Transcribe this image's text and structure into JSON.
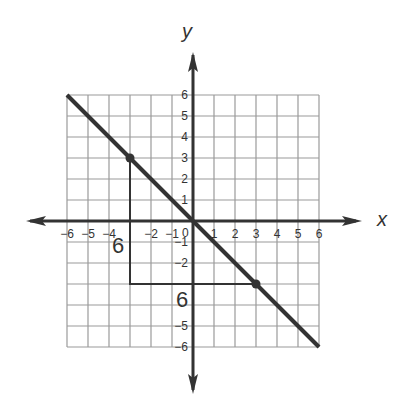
{
  "axes": {
    "x_label": "x",
    "y_label": "y",
    "x_ticks": [
      "−6",
      "−5",
      "−4",
      "−2",
      "−1",
      "1",
      "2",
      "3",
      "4",
      "5",
      "6"
    ],
    "y_ticks": [
      "6",
      "5",
      "4",
      "3",
      "2",
      "1",
      "−1",
      "−2",
      "−5",
      "−6"
    ],
    "origin_label": "0"
  },
  "annotations": {
    "vertical_leg_label": "6",
    "horizontal_leg_label": "6"
  },
  "chart_data": {
    "type": "line",
    "title": "",
    "xlabel": "x",
    "ylabel": "y",
    "xlim": [
      -6,
      6
    ],
    "ylim": [
      -6,
      6
    ],
    "grid": true,
    "series": [
      {
        "name": "line y = -x",
        "x": [
          -6,
          6
        ],
        "y": [
          6,
          -6
        ]
      }
    ],
    "points": [
      {
        "x": -3,
        "y": 3
      },
      {
        "x": 3,
        "y": -3
      }
    ],
    "slope_triangle": {
      "vertices": [
        [
          -3,
          3
        ],
        [
          -3,
          -3
        ],
        [
          3,
          -3
        ]
      ],
      "rise_label": "6",
      "run_label": "6"
    }
  }
}
